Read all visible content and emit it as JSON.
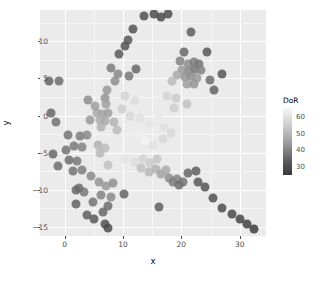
{
  "chart_data": {
    "type": "scatter",
    "title": "",
    "xlabel": "x",
    "ylabel": "y",
    "xlim": [
      -4.2,
      34.5
    ],
    "ylim": [
      -16.2,
      14.2
    ],
    "xticks": [
      0,
      10,
      20,
      30
    ],
    "yticks": [
      -15,
      -10,
      -5,
      0,
      5,
      10
    ],
    "grid": true,
    "panel_background": "#ebebeb",
    "grid_color": "#ffffff",
    "legend": {
      "title": "DoR",
      "position": "right",
      "type": "continuous-colorbar",
      "ticks": [
        30,
        40,
        50,
        60
      ],
      "range": [
        25,
        66
      ],
      "low_color": "#333333",
      "high_color": "#fbfbfb"
    },
    "color_variable": "DoR",
    "point_size": 9,
    "point_opacity": 0.85,
    "points": [
      {
        "x": 13.6,
        "y": 13.4,
        "DoR": 31
      },
      {
        "x": 15.3,
        "y": 13.7,
        "DoR": 30
      },
      {
        "x": 16.6,
        "y": 13.2,
        "DoR": 29
      },
      {
        "x": 17.8,
        "y": 13.6,
        "DoR": 30
      },
      {
        "x": 11.7,
        "y": 11.6,
        "DoR": 32
      },
      {
        "x": 21.6,
        "y": 11.3,
        "DoR": 34
      },
      {
        "x": 10.9,
        "y": 10.2,
        "DoR": 33
      },
      {
        "x": 10.4,
        "y": 9.4,
        "DoR": 32
      },
      {
        "x": 9.3,
        "y": 8.3,
        "DoR": 33
      },
      {
        "x": 12.3,
        "y": 6.2,
        "DoR": 36
      },
      {
        "x": 11.0,
        "y": 5.3,
        "DoR": 39
      },
      {
        "x": 19.7,
        "y": 7.4,
        "DoR": 41
      },
      {
        "x": 21.1,
        "y": 7.0,
        "DoR": 43
      },
      {
        "x": 22.2,
        "y": 7.2,
        "DoR": 40
      },
      {
        "x": 23.0,
        "y": 6.9,
        "DoR": 38
      },
      {
        "x": 20.2,
        "y": 6.1,
        "DoR": 45
      },
      {
        "x": 21.4,
        "y": 6.0,
        "DoR": 42
      },
      {
        "x": 22.4,
        "y": 6.2,
        "DoR": 39
      },
      {
        "x": 23.3,
        "y": 6.1,
        "DoR": 41
      },
      {
        "x": 19.3,
        "y": 5.4,
        "DoR": 48
      },
      {
        "x": 20.6,
        "y": 5.2,
        "DoR": 44
      },
      {
        "x": 21.7,
        "y": 5.3,
        "DoR": 43
      },
      {
        "x": 22.7,
        "y": 5.1,
        "DoR": 45
      },
      {
        "x": 21.0,
        "y": 4.3,
        "DoR": 46
      },
      {
        "x": 22.1,
        "y": 4.2,
        "DoR": 44
      },
      {
        "x": 20.4,
        "y": 8.6,
        "DoR": 36
      },
      {
        "x": 24.4,
        "y": 8.5,
        "DoR": 33
      },
      {
        "x": 26.9,
        "y": 5.6,
        "DoR": 32
      },
      {
        "x": 18.4,
        "y": 4.6,
        "DoR": 52
      },
      {
        "x": 17.6,
        "y": 2.6,
        "DoR": 57
      },
      {
        "x": 19.1,
        "y": 2.4,
        "DoR": 55
      },
      {
        "x": 21.0,
        "y": 1.6,
        "DoR": 53
      },
      {
        "x": -2.6,
        "y": 4.7,
        "DoR": 35
      },
      {
        "x": -0.9,
        "y": 4.7,
        "DoR": 37
      },
      {
        "x": 8.6,
        "y": 4.6,
        "DoR": 43
      },
      {
        "x": 7.2,
        "y": 3.4,
        "DoR": 45
      },
      {
        "x": 6.9,
        "y": 2.4,
        "DoR": 44
      },
      {
        "x": 7.1,
        "y": 1.5,
        "DoR": 46
      },
      {
        "x": -2.3,
        "y": 0.4,
        "DoR": 36
      },
      {
        "x": -1.4,
        "y": -0.9,
        "DoR": 38
      },
      {
        "x": 5.6,
        "y": 0.4,
        "DoR": 48
      },
      {
        "x": 6.5,
        "y": 0.2,
        "DoR": 47
      },
      {
        "x": 7.4,
        "y": 0.3,
        "DoR": 46
      },
      {
        "x": 6.0,
        "y": -0.6,
        "DoR": 49
      },
      {
        "x": 6.9,
        "y": -0.7,
        "DoR": 48
      },
      {
        "x": 6.3,
        "y": -1.5,
        "DoR": 50
      },
      {
        "x": 9.8,
        "y": 0.9,
        "DoR": 56
      },
      {
        "x": 11.2,
        "y": 0.0,
        "DoR": 58
      },
      {
        "x": 12.9,
        "y": -0.3,
        "DoR": 60
      },
      {
        "x": 14.6,
        "y": -1.0,
        "DoR": 61
      },
      {
        "x": 16.1,
        "y": -0.4,
        "DoR": 62
      },
      {
        "x": 12.1,
        "y": 2.0,
        "DoR": 59
      },
      {
        "x": 10.3,
        "y": 2.6,
        "DoR": 57
      },
      {
        "x": 0.6,
        "y": -2.6,
        "DoR": 38
      },
      {
        "x": 2.6,
        "y": -2.7,
        "DoR": 40
      },
      {
        "x": 3.9,
        "y": -2.6,
        "DoR": 42
      },
      {
        "x": 1.6,
        "y": -4.1,
        "DoR": 39
      },
      {
        "x": 3.0,
        "y": -4.2,
        "DoR": 41
      },
      {
        "x": 5.8,
        "y": -3.9,
        "DoR": 50
      },
      {
        "x": 7.0,
        "y": -4.3,
        "DoR": 52
      },
      {
        "x": 6.1,
        "y": -5.1,
        "DoR": 51
      },
      {
        "x": 0.7,
        "y": -6.0,
        "DoR": 37
      },
      {
        "x": 2.1,
        "y": -6.1,
        "DoR": 39
      },
      {
        "x": 7.5,
        "y": -6.6,
        "DoR": 53
      },
      {
        "x": 12.4,
        "y": -2.4,
        "DoR": 63
      },
      {
        "x": 13.8,
        "y": -3.4,
        "DoR": 64
      },
      {
        "x": 11.6,
        "y": -4.3,
        "DoR": 62
      },
      {
        "x": 15.2,
        "y": -4.0,
        "DoR": 60
      },
      {
        "x": 16.8,
        "y": -3.2,
        "DoR": 58
      },
      {
        "x": 10.4,
        "y": -5.9,
        "DoR": 61
      },
      {
        "x": 12.0,
        "y": -6.2,
        "DoR": 59
      },
      {
        "x": 13.5,
        "y": -5.8,
        "DoR": 57
      },
      {
        "x": 14.7,
        "y": -6.4,
        "DoR": 55
      },
      {
        "x": 15.9,
        "y": -5.9,
        "DoR": 54
      },
      {
        "x": 13.1,
        "y": -7.1,
        "DoR": 53
      },
      {
        "x": 14.4,
        "y": -7.6,
        "DoR": 51
      },
      {
        "x": 15.6,
        "y": -7.2,
        "DoR": 50
      },
      {
        "x": 16.5,
        "y": -7.9,
        "DoR": 47
      },
      {
        "x": 17.3,
        "y": -7.3,
        "DoR": 48
      },
      {
        "x": 17.9,
        "y": -8.4,
        "DoR": 43
      },
      {
        "x": 18.6,
        "y": -9.0,
        "DoR": 40
      },
      {
        "x": 19.2,
        "y": -8.5,
        "DoR": 41
      },
      {
        "x": 19.6,
        "y": -9.4,
        "DoR": 37
      },
      {
        "x": 20.3,
        "y": -8.9,
        "DoR": 38
      },
      {
        "x": 21.2,
        "y": -7.7,
        "DoR": 36
      },
      {
        "x": 22.5,
        "y": -7.4,
        "DoR": 34
      },
      {
        "x": 22.9,
        "y": -8.9,
        "DoR": 33
      },
      {
        "x": 24.1,
        "y": -9.6,
        "DoR": 32
      },
      {
        "x": 25.4,
        "y": -11.1,
        "DoR": 31
      },
      {
        "x": 27.0,
        "y": -12.5,
        "DoR": 30
      },
      {
        "x": 28.6,
        "y": -13.2,
        "DoR": 29
      },
      {
        "x": 30.0,
        "y": -13.9,
        "DoR": 28
      },
      {
        "x": 31.3,
        "y": -14.6,
        "DoR": 27
      },
      {
        "x": 32.4,
        "y": -15.2,
        "DoR": 26
      },
      {
        "x": 1.4,
        "y": -7.5,
        "DoR": 38
      },
      {
        "x": 3.0,
        "y": -7.3,
        "DoR": 40
      },
      {
        "x": 4.6,
        "y": -8.1,
        "DoR": 42
      },
      {
        "x": 5.9,
        "y": -8.9,
        "DoR": 44
      },
      {
        "x": 7.1,
        "y": -9.5,
        "DoR": 45
      },
      {
        "x": 8.3,
        "y": -9.1,
        "DoR": 43
      },
      {
        "x": 3.4,
        "y": -10.3,
        "DoR": 39
      },
      {
        "x": 6.2,
        "y": -10.7,
        "DoR": 41
      },
      {
        "x": 8.0,
        "y": -11.0,
        "DoR": 42
      },
      {
        "x": 4.9,
        "y": -11.6,
        "DoR": 38
      },
      {
        "x": 7.4,
        "y": -12.2,
        "DoR": 37
      },
      {
        "x": 6.6,
        "y": -13.0,
        "DoR": 36
      },
      {
        "x": 2.4,
        "y": -9.8,
        "DoR": 37
      },
      {
        "x": 1.9,
        "y": -11.9,
        "DoR": 35
      },
      {
        "x": 16.2,
        "y": -12.3,
        "DoR": 34
      },
      {
        "x": 2.0,
        "y": -10.0,
        "DoR": 36
      },
      {
        "x": 3.8,
        "y": -13.4,
        "DoR": 34
      },
      {
        "x": 5.0,
        "y": -13.9,
        "DoR": 33
      },
      {
        "x": 6.9,
        "y": -14.6,
        "DoR": 31
      },
      {
        "x": 7.5,
        "y": -15.1,
        "DoR": 30
      },
      {
        "x": 10.2,
        "y": -10.5,
        "DoR": 35
      },
      {
        "x": -2.0,
        "y": -5.2,
        "DoR": 36
      },
      {
        "x": -1.1,
        "y": -6.8,
        "DoR": 37
      },
      {
        "x": 0.2,
        "y": -4.6,
        "DoR": 38
      },
      {
        "x": 4.3,
        "y": -0.6,
        "DoR": 45
      },
      {
        "x": 5.2,
        "y": 1.3,
        "DoR": 46
      },
      {
        "x": 4.0,
        "y": 2.1,
        "DoR": 43
      },
      {
        "x": 9.2,
        "y": 5.6,
        "DoR": 42
      },
      {
        "x": 8.0,
        "y": 6.4,
        "DoR": 40
      },
      {
        "x": 18.8,
        "y": 1.0,
        "DoR": 56
      },
      {
        "x": 24.9,
        "y": 4.8,
        "DoR": 37
      },
      {
        "x": 25.6,
        "y": 3.4,
        "DoR": 35
      },
      {
        "x": 9.0,
        "y": -2.0,
        "DoR": 52
      },
      {
        "x": 8.4,
        "y": -0.9,
        "DoR": 50
      },
      {
        "x": 17.0,
        "y": -1.6,
        "DoR": 60
      },
      {
        "x": 18.3,
        "y": -2.3,
        "DoR": 58
      }
    ]
  }
}
